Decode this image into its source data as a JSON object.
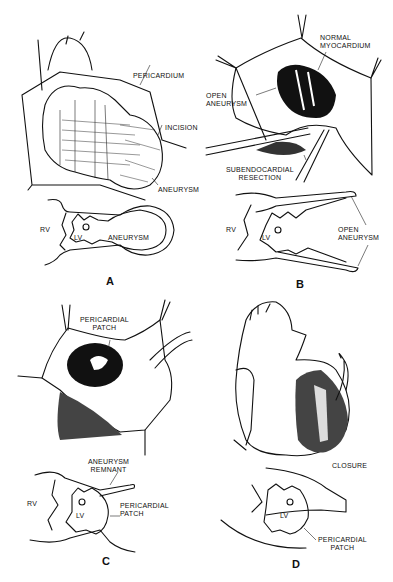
{
  "figure": {
    "panels": [
      {
        "id": "A",
        "letter": "A",
        "labels": {
          "pericardium": "PERICARDIUM",
          "incision": "INCISION",
          "aneurysm": "ANEURYSM",
          "rv": "RV",
          "lv": "LV",
          "section_aneurysm": "ANEURYSM"
        }
      },
      {
        "id": "B",
        "letter": "B",
        "labels": {
          "normal_myocardium": "NORMAL\nMYOCARDIUM",
          "open_aneurysm": "OPEN\nANEURYSM",
          "subendocardial_resection": "SUBENDOCARDIAL\nRESECTION",
          "rv": "RV",
          "lv": "LV",
          "section_open_aneurysm": "OPEN\nANEURYSM"
        }
      },
      {
        "id": "C",
        "letter": "C",
        "labels": {
          "pericardial_patch": "PERICARDIAL\nPATCH",
          "aneurysm_remnant": "ANEURYSM\nREMNANT",
          "rv": "RV",
          "lv": "LV",
          "section_pericardial_patch": "PERICARDIAL\nPATCH"
        }
      },
      {
        "id": "D",
        "letter": "D",
        "labels": {
          "closure": "CLOSURE",
          "lv": "LV",
          "section_pericardial_patch": "PERICARDIAL\nPATCH"
        }
      }
    ]
  }
}
